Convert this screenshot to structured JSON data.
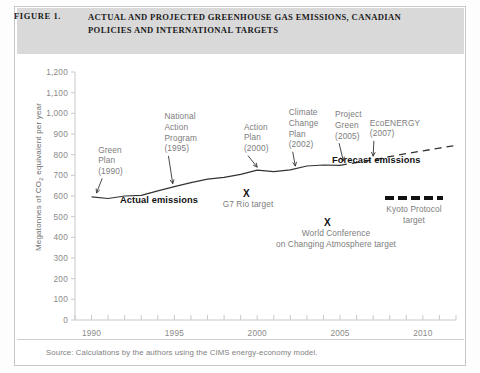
{
  "figure": {
    "label": "FIGURE 1.",
    "title": "ACTUAL AND PROJECTED GREENHOUSE GAS EMISSIONS, CANADIAN POLICIES AND INTERNATIONAL TARGETS",
    "source": "Source: Calculations by the authors using the CIMS energy-economy model."
  },
  "colors": {
    "band": "#d9d9d9",
    "axis": "#c9c9c9",
    "tick_text": "#8a8a8a",
    "line": "#333333",
    "bold_text": "#111111",
    "annotation_text": "#7d7d7d"
  },
  "chart_data": {
    "type": "line",
    "title": "ACTUAL AND PROJECTED GREENHOUSE GAS EMISSIONS, CANADIAN POLICIES AND INTERNATIONAL TARGETS",
    "xlabel": "",
    "ylabel": "Megatonnes of CO2 equivalent per year",
    "ylabel_parts": {
      "pre": "Megatonnes of  CO",
      "sub": "2",
      "post": " equivalent per year"
    },
    "xlim": [
      1989,
      2012
    ],
    "ylim": [
      0,
      1200
    ],
    "grid": false,
    "yticks": [
      0,
      100,
      200,
      300,
      400,
      500,
      600,
      700,
      800,
      900,
      1000,
      1100,
      1200
    ],
    "ytick_labels": [
      "0",
      "100",
      "200",
      "300",
      "400",
      "500",
      "600",
      "700",
      "800",
      "900",
      "1,000",
      "1,100",
      "1,200"
    ],
    "xticks": [
      1990,
      1995,
      2000,
      2005,
      2010
    ],
    "xtick_labels": [
      "1990",
      "1995",
      "2000",
      "2005",
      "2010"
    ],
    "xminor_step": 1,
    "legend_position": "inline-annotations",
    "series": [
      {
        "name": "Actual emissions",
        "style": "solid",
        "x": [
          1990,
          1991,
          1992,
          1993,
          1994,
          1995,
          1996,
          1997,
          1998,
          1999,
          2000,
          2001,
          2002,
          2003,
          2004,
          2005
        ],
        "values": [
          596,
          588,
          600,
          603,
          625,
          645,
          665,
          682,
          690,
          705,
          725,
          718,
          727,
          745,
          750,
          748
        ]
      },
      {
        "name": "Forecast emissions",
        "style": "dashed",
        "x": [
          2005,
          2006,
          2007,
          2008,
          2009,
          2010,
          2011,
          2012
        ],
        "values": [
          748,
          762,
          775,
          790,
          805,
          818,
          832,
          845
        ]
      }
    ],
    "markers": [
      {
        "name": "G7 Rio target",
        "symbol": "X",
        "x": 1999.6,
        "y": 565
      },
      {
        "name": "World Conference on Changing Atmosphere target",
        "symbol": "X",
        "x": 2004.4,
        "y": 440
      }
    ],
    "annotations": [
      {
        "name": "green-plan",
        "text": "Green\nPlan\n(1990)",
        "x": 1990.4,
        "y": 820,
        "align": "left"
      },
      {
        "name": "national-action-program",
        "text": "National\nAction\nProgram\n(1995)",
        "x": 1994.4,
        "y": 980,
        "align": "left"
      },
      {
        "name": "action-plan",
        "text": "Action\nPlan\n(2000)",
        "x": 1999.2,
        "y": 930,
        "align": "left"
      },
      {
        "name": "climate-change-plan",
        "text": "Climate\nChange\nPlan\n(2002)",
        "x": 2001.9,
        "y": 1000,
        "align": "left"
      },
      {
        "name": "project-green",
        "text": "Project\nGreen\n(2005)",
        "x": 2004.7,
        "y": 990,
        "align": "left"
      },
      {
        "name": "eco-energy",
        "text": "EcoENERGY\n(2007)",
        "x": 2006.8,
        "y": 950,
        "align": "left"
      }
    ],
    "inline_labels": [
      {
        "name": "actual-emissions-label",
        "text": "Actual emissions",
        "bold": true
      },
      {
        "name": "forecast-emissions-label",
        "text": "Forecast emissions",
        "bold": true
      }
    ],
    "legend_items": [
      {
        "name": "kyoto-protocol-target",
        "text": "Kyoto Protocol\ntarget",
        "style": "thick-dashed"
      }
    ]
  },
  "labels": {
    "actual_emissions": "Actual emissions",
    "forecast_emissions": "Forecast emissions",
    "g7_rio": "G7 Rio target",
    "world_conf": "World Conference\non Changing Atmosphere target",
    "kyoto": "Kyoto Protocol\ntarget",
    "x_symbol": "X"
  }
}
